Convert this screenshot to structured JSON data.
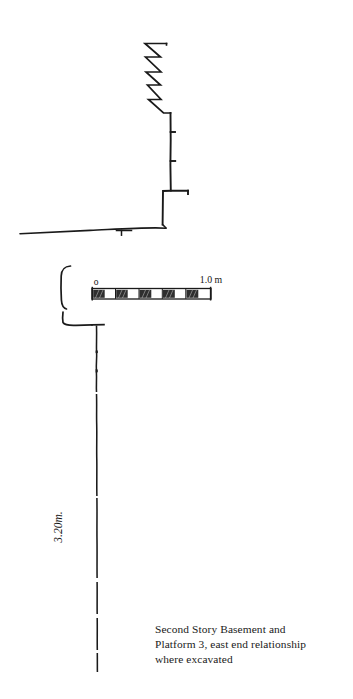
{
  "figure": {
    "name": "archaeological-section-drawing",
    "background_color": "#ffffff",
    "ink_color": "#1a1a1a",
    "caption": {
      "lines": [
        "Second Story Basement and",
        "Platform 3, east end relationship",
        "where excavated"
      ],
      "full_text": "Second Story Basement and Platform 3, east end relationship where excavated"
    },
    "scale_bar": {
      "label_left": "o",
      "label_right": "1.0 m",
      "segments": 5,
      "segment_pattern": [
        "hatched",
        "white",
        "hatched",
        "white",
        "hatched",
        "white",
        "hatched",
        "white",
        "hatched",
        "white"
      ],
      "hatch_color": "#2a2a2a",
      "total_length_m": 1.0
    },
    "dimension_labels": [
      {
        "name": "depth-dimension",
        "text": "3.20m.",
        "orientation": "vertical-rotated",
        "measures": "wall height below platform"
      }
    ],
    "annotations": {
      "break_symbol": "zigzag-break",
      "ground_line": "sloping-ground-surface",
      "wall_line": "vertical-wall-face",
      "tick_marks": 2,
      "bracket": "left-bracket-connector"
    }
  }
}
